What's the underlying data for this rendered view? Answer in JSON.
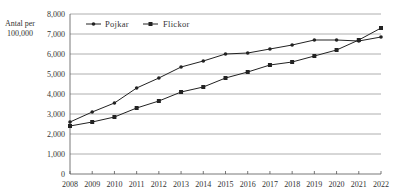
{
  "chart_data": {
    "type": "line",
    "title": "",
    "xlabel": "",
    "ylabel": "Antal per 100,000",
    "ylabel_lines": [
      "Antal per",
      "100,000"
    ],
    "x": [
      2008,
      2009,
      2010,
      2011,
      2012,
      2013,
      2014,
      2015,
      2016,
      2017,
      2018,
      2019,
      2020,
      2021,
      2022
    ],
    "ylim": [
      0,
      8000
    ],
    "yticks": [
      0,
      1000,
      2000,
      3000,
      4000,
      5000,
      6000,
      7000,
      8000
    ],
    "ytick_labels": [
      "0",
      "1,000",
      "2,000",
      "3,000",
      "4,000",
      "5,000",
      "6,000",
      "7,000",
      "8,000"
    ],
    "grid": "horizontal",
    "legend_position": "top-left inside",
    "series": [
      {
        "name": "Pojkar",
        "marker": "circle",
        "color": "#222222",
        "values": [
          2600,
          3100,
          3550,
          4300,
          4800,
          5350,
          5650,
          6000,
          6050,
          6250,
          6450,
          6700,
          6700,
          6650,
          6850
        ]
      },
      {
        "name": "Flickor",
        "marker": "square",
        "color": "#222222",
        "values": [
          2400,
          2600,
          2850,
          3300,
          3650,
          4100,
          4350,
          4800,
          5100,
          5450,
          5600,
          5900,
          6200,
          6700,
          7300
        ]
      }
    ]
  },
  "colors": {
    "line": "#222222",
    "grid": "#9a9a9a",
    "axis": "#555555",
    "text": "#333333"
  }
}
